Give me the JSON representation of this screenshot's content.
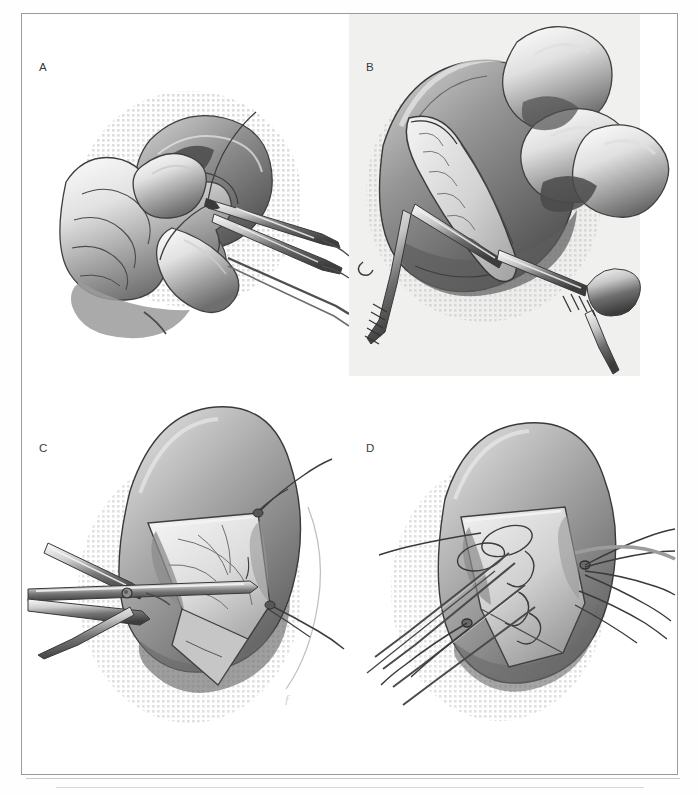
{
  "figure": {
    "kind": "surgical-illustration-plate",
    "medium": "graphite / halftone stipple line art, grayscale",
    "panel_count": 4,
    "page_background": "#ffffff",
    "frame_color": "#9a9a9a",
    "ink_dark": "#2f2f2f",
    "ink_mid": "#7d7d7d",
    "ink_light": "#bdbdbd",
    "stipple_color": "#c4c4c4",
    "plate_tint": "#f0f0ef"
  },
  "panels": [
    {
      "id": "a",
      "label": "A",
      "caption_text": "",
      "subject": "Surgeon's gloved hand cradling mobilized bowel/organ while forceps grasp tissue; suture strand drawn upward",
      "elements": [
        "gloved-left-hand",
        "mobilized-organ-mass",
        "forceps-instrument",
        "suture-strand",
        "stipple-shadow-field"
      ]
    },
    {
      "id": "b",
      "label": "B",
      "caption_text": "",
      "subject": "Longitudinal incision opened with two toothed forceps retracting the edges; surgeon's fingers steady the organ above",
      "elements": [
        "gloved-fingers",
        "organ-body",
        "longitudinal-incision",
        "toothed-forceps-left",
        "toothed-forceps-right",
        "exposed-lumen",
        "stipple-shadow-field"
      ],
      "has_grey_plate": true
    },
    {
      "id": "c",
      "label": "C",
      "caption_text": "",
      "subject": "Hinged surgical scissors/clamp within the opened flap; stay sutures tension the corners of the triangular flap",
      "elements": [
        "surgical-scissors",
        "scissors-hinge-rivet",
        "triangular-flap",
        "vascular-markings",
        "stay-suture-upper-right",
        "stay-suture-lower-right",
        "stipple-shadow-field",
        "artist-signature"
      ]
    },
    {
      "id": "d",
      "label": "D",
      "caption_text": "",
      "subject": "Row of interrupted sutures placed across the flap with needles and long thread tails radiating outward",
      "elements": [
        "organ-body",
        "flap-opening",
        "suture-needle-set",
        "interrupted-suture-loops",
        "long-thread-tails",
        "stipple-shadow-field"
      ]
    }
  ],
  "marks": {
    "artist_signature": "ƒ"
  }
}
